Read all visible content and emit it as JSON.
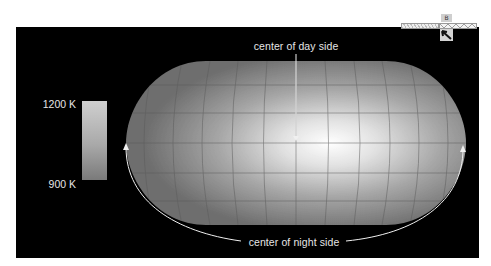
{
  "figure": {
    "annotations": {
      "day_side_label": "center of day side",
      "night_side_label": "center of night side"
    },
    "colorbar": {
      "max_label": "1200 K",
      "min_label": "900 K",
      "max_color": "#cfcfcf",
      "min_color": "#7a7a7a"
    },
    "map": {
      "projection": "pseudo-cylindrical global map",
      "hotspot_color": "#ffffff",
      "background_color": "#000000"
    }
  },
  "widget": {
    "tab_label": "B",
    "icon": "cursor-arrow-icon"
  }
}
